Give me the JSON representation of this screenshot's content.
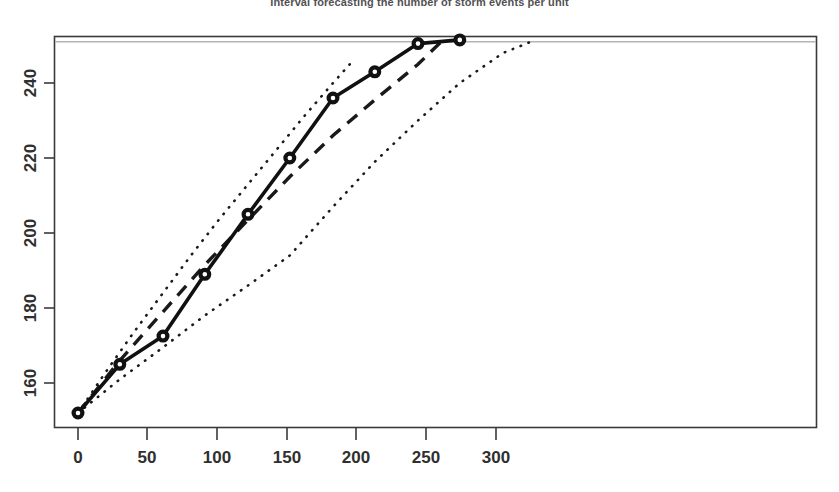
{
  "chart": {
    "title": "Interval forecasting the number of storm events per unit",
    "title_visible": "partially cropped at top edge"
  },
  "chart_data": {
    "type": "line",
    "title": "Interval forecasting the number of storm events per unit",
    "xlabel": "",
    "ylabel": "",
    "xlim": [
      -8,
      330
    ],
    "ylim": [
      148,
      254
    ],
    "grid": false,
    "legend": "none",
    "x_ticks": [
      0,
      50,
      100,
      150,
      200,
      250,
      300
    ],
    "x_tick_labels": [
      "0",
      "50",
      "100",
      "150",
      "200",
      "250",
      "300"
    ],
    "y_ticks": [
      160,
      180,
      200,
      220,
      240
    ],
    "y_tick_labels": [
      "160",
      "180",
      "200",
      "220",
      "240"
    ],
    "reference_line": {
      "orientation": "horizontal",
      "y": 251,
      "style": "solid",
      "color": "#b4b4b4",
      "label": ""
    },
    "series": [
      {
        "name": "Observed",
        "style": "solid",
        "marker": "open-circle",
        "color": "#111111",
        "x": [
          0,
          30,
          61,
          91,
          122,
          152,
          183,
          213,
          244,
          274
        ],
        "y": [
          152,
          165,
          172.5,
          189,
          205,
          220,
          236,
          243,
          250.5,
          251.5
        ]
      },
      {
        "name": "Point forecast",
        "style": "dashed",
        "marker": "none",
        "color": "#1a1a1a",
        "x": [
          0,
          30,
          61,
          91,
          122,
          152,
          183,
          213,
          244,
          262
        ],
        "y": [
          152,
          166,
          179,
          191.5,
          203.5,
          215,
          226,
          235.5,
          245,
          251.5
        ]
      },
      {
        "name": "Upper prediction limit",
        "style": "dotted",
        "marker": "none",
        "color": "#1a1a1a",
        "x": [
          0,
          20,
          40,
          61,
          81,
          101,
          122,
          142,
          162,
          183,
          195
        ],
        "y": [
          152,
          163,
          173.5,
          184,
          194,
          203.5,
          213,
          222,
          231,
          240,
          245
        ]
      },
      {
        "name": "Lower prediction limit",
        "style": "dotted",
        "marker": "none",
        "color": "#1a1a1a",
        "x": [
          0,
          30,
          61,
          91,
          122,
          152,
          183,
          213,
          244,
          274,
          305,
          325
        ],
        "y": [
          152,
          161,
          169.5,
          178,
          186,
          194,
          207,
          219,
          230,
          240,
          248,
          251
        ]
      }
    ]
  }
}
